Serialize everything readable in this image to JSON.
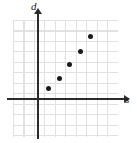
{
  "figure": {
    "name": "scatter-plot",
    "background_color": "#ffffff",
    "grid_color": "#c9c9c9",
    "axis_color": "#2b2b2b",
    "point_color": "#1a1a1a"
  },
  "chart_data": {
    "type": "scatter",
    "title": "",
    "xlabel": "s",
    "ylabel": "d",
    "grid": true,
    "legend": null,
    "xlim": [
      -2.5,
      7.5
    ],
    "ylim": [
      -4,
      7.5
    ],
    "x": [
      1,
      2,
      3,
      4,
      5
    ],
    "y": [
      1,
      2,
      3.3,
      4.5,
      6
    ],
    "points": [
      {
        "x": 1,
        "y": 1
      },
      {
        "x": 2,
        "y": 2
      },
      {
        "x": 3,
        "y": 3.3
      },
      {
        "x": 4,
        "y": 4.5
      },
      {
        "x": 5,
        "y": 6
      }
    ],
    "series": [
      {
        "name": "",
        "values": [
          1,
          2,
          3.3,
          4.5,
          6
        ]
      }
    ]
  },
  "axes": {
    "y_label": "d",
    "x_label": "s",
    "origin_px": {
      "x": 38,
      "y": 99
    },
    "cell_px": 10.5
  },
  "icons": {
    "y_arrow": "arrow-up-icon",
    "x_arrow": "arrow-right-icon"
  }
}
